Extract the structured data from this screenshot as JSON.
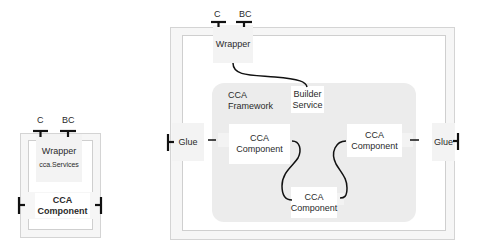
{
  "small_diagram": {
    "port_c": "C",
    "port_bc": "BC",
    "wrapper_title": "Wrapper",
    "wrapper_subtitle": "cca.Services",
    "component_line1": "CCA",
    "component_line2": "Component"
  },
  "large_diagram": {
    "port_c": "C",
    "port_bc": "BC",
    "wrapper": "Wrapper",
    "framework_line1": "CCA",
    "framework_line2": "Framework",
    "builder_line1": "Builder",
    "builder_line2": "Service",
    "glue_left": "Glue",
    "glue_right": "Glue",
    "component_left": {
      "line1": "CCA",
      "line2": "Component"
    },
    "component_right": {
      "line1": "CCA",
      "line2": "Component"
    },
    "component_bottom": {
      "line1": "CCA",
      "line2": "Component"
    }
  },
  "colors": {
    "frame": "#f6f6f6",
    "framework": "#ececec",
    "box": "#f3f3f3",
    "line": "#111111"
  }
}
